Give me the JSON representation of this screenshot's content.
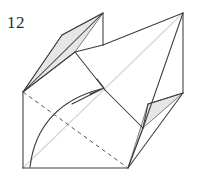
{
  "figure": {
    "type": "origami-fold-diagram",
    "step_label": "12",
    "background_color": "#ffffff",
    "stroke_color": "#3c3c3c",
    "light_stroke_color": "#d8d8d8",
    "shade_fill_color": "#e6e6e6",
    "shade_stroke_color": "#6e6e6e",
    "dashed_stroke_color": "#555555",
    "arrow_color": "#3c3c3c",
    "canvas": {
      "width": 203,
      "height": 175
    }
  },
  "geometry": {
    "points": {
      "left_corner": [
        23,
        92
      ],
      "bottom_left_corner": [
        23,
        168
      ],
      "bottom_mid": [
        128,
        168
      ],
      "top_left_peak": [
        103,
        13
      ],
      "top_right_peak": [
        183,
        13
      ],
      "right_corner": [
        183,
        93
      ],
      "wedge_left_mid": [
        62,
        35
      ],
      "center_cross": [
        105,
        90
      ],
      "upper_notch": [
        103,
        45
      ],
      "right_notch": [
        148,
        104
      ],
      "mid_fold_join": [
        75,
        52
      ],
      "lower_right_join": [
        143,
        128
      ]
    },
    "shaded_regions": [
      {
        "name": "upper-left-shaded-flap",
        "polygon": [
          [
            23,
            92
          ],
          [
            62,
            35
          ],
          [
            103,
            13
          ],
          [
            75,
            52
          ]
        ]
      },
      {
        "name": "lower-right-shaded-flap",
        "polygon": [
          [
            183,
            93
          ],
          [
            148,
            104
          ],
          [
            128,
            168
          ],
          [
            143,
            128
          ]
        ]
      }
    ],
    "solid_edges": [
      {
        "name": "left-vertical-edge",
        "path": [
          [
            23,
            92
          ],
          [
            23,
            168
          ]
        ]
      },
      {
        "name": "bottom-edge",
        "path": [
          [
            23,
            168
          ],
          [
            128,
            168
          ]
        ]
      },
      {
        "name": "left-to-top-left-peak",
        "path": [
          [
            23,
            92
          ],
          [
            103,
            13
          ]
        ]
      },
      {
        "name": "left-to-wedge-mid",
        "path": [
          [
            23,
            92
          ],
          [
            62,
            35
          ]
        ]
      },
      {
        "name": "wedge-mid-to-top-left-peak",
        "path": [
          [
            62,
            35
          ],
          [
            103,
            13
          ]
        ]
      },
      {
        "name": "wedge-inner-fold",
        "path": [
          [
            23,
            92
          ],
          [
            75,
            52
          ]
        ]
      },
      {
        "name": "top-left-peak-vertical",
        "path": [
          [
            103,
            13
          ],
          [
            103,
            45
          ]
        ]
      },
      {
        "name": "upper-notch-to-mid",
        "path": [
          [
            103,
            45
          ],
          [
            75,
            52
          ]
        ]
      },
      {
        "name": "mid-to-center",
        "path": [
          [
            75,
            52
          ],
          [
            105,
            90
          ]
        ]
      },
      {
        "name": "upper-notch-to-top-right-peak",
        "path": [
          [
            103,
            45
          ],
          [
            183,
            13
          ]
        ]
      },
      {
        "name": "top-right-peak-to-right-corner",
        "path": [
          [
            183,
            13
          ],
          [
            183,
            93
          ]
        ]
      },
      {
        "name": "top-right-peak-to-lower-right",
        "path": [
          [
            183,
            13
          ],
          [
            143,
            128
          ]
        ]
      },
      {
        "name": "center-to-lower-right",
        "path": [
          [
            105,
            90
          ],
          [
            143,
            128
          ]
        ]
      },
      {
        "name": "right-corner-to-notch",
        "path": [
          [
            183,
            93
          ],
          [
            148,
            104
          ]
        ]
      },
      {
        "name": "notch-to-lower-right",
        "path": [
          [
            148,
            104
          ],
          [
            143,
            128
          ]
        ]
      },
      {
        "name": "right-corner-to-bottom-mid",
        "path": [
          [
            183,
            93
          ],
          [
            128,
            168
          ]
        ]
      },
      {
        "name": "lower-right-to-bottom-mid",
        "path": [
          [
            143,
            128
          ],
          [
            128,
            168
          ]
        ]
      }
    ],
    "light_edges": [
      {
        "name": "light-diagonal-main",
        "path": [
          [
            23,
            168
          ],
          [
            183,
            13
          ]
        ]
      }
    ],
    "dashed_edges": [
      {
        "name": "dashed-fold-line",
        "path": [
          [
            23,
            92
          ],
          [
            128,
            168
          ]
        ]
      }
    ],
    "arrow": {
      "name": "fold-direction-arrow",
      "curve": "M 30 167 C 36 126 62 100 100 90",
      "head_from": [
        74,
        103
      ],
      "head_tip": [
        104,
        88
      ],
      "head_left": [
        92,
        95
      ],
      "head_right": [
        98,
        80
      ]
    }
  }
}
